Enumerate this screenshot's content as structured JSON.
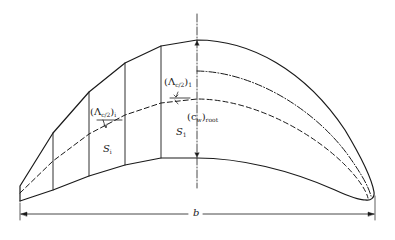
{
  "diagram": {
    "type": "wing planform (half-span sectioned, left side) with sweep angle and chord annotations",
    "colors": {
      "line": "#1a1a1a",
      "background": "#ffffff"
    },
    "labels": {
      "sweep_left": {
        "open": "(Λ",
        "sub": "c/2",
        "close": ")",
        "index": "i"
      },
      "sweep_right": {
        "open": "(Λ",
        "sub": "c/2",
        "close": ")",
        "index": "1"
      },
      "root_chord": {
        "open": "(c",
        "sub": "w",
        "close": ")",
        "index": "root"
      },
      "area_left": {
        "symbol": "S",
        "index": "i"
      },
      "area_right": {
        "symbol": "S",
        "index": "1"
      },
      "span": "b"
    },
    "elements": [
      "leading-edge (piecewise on left, curved on right)",
      "trailing-edge",
      "half-chord sweep line (dashed)",
      "quarter-chord / reference line (dash-dot, right half)",
      "panel dividers (4 vertical lines)",
      "root chord centerline (dash-dot)",
      "span dimension line b"
    ]
  }
}
